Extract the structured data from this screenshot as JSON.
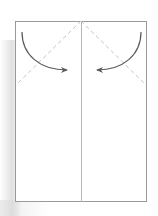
{
  "diagram": {
    "type": "origami-fold-step",
    "colors": {
      "paper_edge": "#9a9a9a",
      "center_crease": "#b5b5b5",
      "valley_fold_dash": "#c4c4c4",
      "arrow": "#5a5a5a",
      "background": "#ffffff"
    },
    "paper": {
      "x": 15,
      "y": 21,
      "width": 132,
      "height": 181
    },
    "center_line": {
      "x": 81,
      "y1": 21,
      "y2": 202
    },
    "fold_lines": [
      {
        "name": "left-valley-fold",
        "x1": 81,
        "y1": 21,
        "x2": 15,
        "y2": 85
      },
      {
        "name": "right-valley-fold",
        "x1": 81,
        "y1": 21,
        "x2": 147,
        "y2": 85
      }
    ],
    "arrows": [
      {
        "name": "left-fold-arrow",
        "from": [
          22,
          32
        ],
        "to": [
          68,
          70
        ]
      },
      {
        "name": "right-fold-arrow",
        "from": [
          141,
          32
        ],
        "to": [
          96,
          70
        ]
      }
    ]
  }
}
